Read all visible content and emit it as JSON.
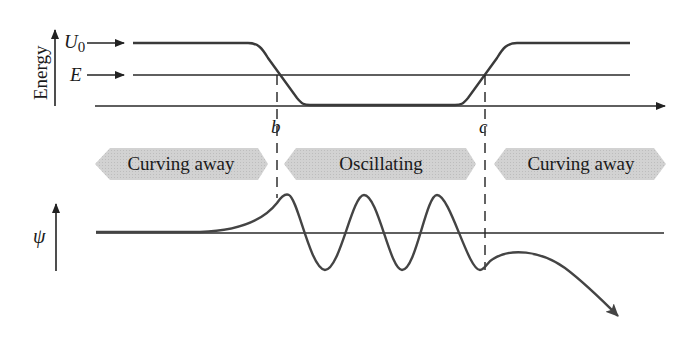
{
  "diagram": {
    "type": "finite potential well: energy diagram and wavefunction",
    "energy_panel": {
      "axis_label": "Energy",
      "levels": [
        {
          "name": "U0",
          "label": "U",
          "subscript": "0"
        },
        {
          "name": "E",
          "label": "E"
        }
      ]
    },
    "turning_points": [
      {
        "id": "b",
        "label": "b"
      },
      {
        "id": "c",
        "label": "c"
      }
    ],
    "regions": [
      {
        "label": "Curving away",
        "direction": "left"
      },
      {
        "label": "Oscillating",
        "direction": "both"
      },
      {
        "label": "Curving away",
        "direction": "right"
      }
    ],
    "wavefunction_panel": {
      "axis_label": "ψ"
    }
  },
  "colors": {
    "line": "#2a2a2a",
    "curve": "#444444",
    "banner_fill": "#cfcfcf",
    "banner_text": "#1a1a1a"
  }
}
